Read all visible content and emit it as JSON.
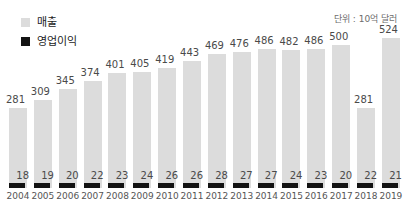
{
  "legend": {
    "items": [
      {
        "label": "매출",
        "color": "#dcdcdc",
        "swatch_name": "legend-swatch-revenue"
      },
      {
        "label": "영업이익",
        "color": "#131313",
        "swatch_name": "legend-swatch-profit"
      }
    ]
  },
  "unit_note": "단위 : 10억 달러",
  "chart_data": {
    "type": "bar",
    "title": "",
    "subtitle": "",
    "xlabel": "",
    "ylabel": "",
    "unit": "단위 : 10억 달러",
    "grid": false,
    "legend_position": "top-left",
    "axis_line": false,
    "ylim": [
      0,
      560
    ],
    "categories": [
      "2004",
      "2005",
      "2006",
      "2007",
      "2008",
      "2009",
      "2010",
      "2011",
      "2012",
      "2013",
      "2014",
      "2015",
      "2016",
      "2017",
      "2018",
      "2019"
    ],
    "series": [
      {
        "name": "매출",
        "color": "#dcdcdc",
        "values": [
          281,
          309,
          345,
          374,
          401,
          405,
          419,
          443,
          469,
          476,
          486,
          482,
          486,
          500,
          281,
          524
        ]
      },
      {
        "name": "영업이익",
        "color": "#131313",
        "values": [
          18,
          19,
          20,
          22,
          23,
          24,
          26,
          26,
          28,
          27,
          27,
          24,
          23,
          20,
          22,
          21
        ]
      }
    ]
  }
}
